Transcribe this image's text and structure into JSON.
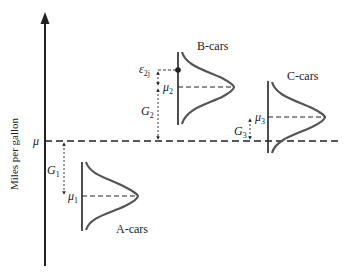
{
  "diagram": {
    "y_axis_label": "Miles per gallon",
    "baseline_label": "μ",
    "colors": {
      "ink": "#222222",
      "curve": "#555555",
      "background": "#ffffff"
    },
    "groups": [
      {
        "name": "A-cars",
        "mean_symbol": "μ",
        "mean_sub": "1",
        "gap_symbol": "G",
        "gap_sub": "1"
      },
      {
        "name": "B-cars",
        "mean_symbol": "μ",
        "mean_sub": "2",
        "gap_symbol": "G",
        "gap_sub": "2",
        "error_symbol": "ε",
        "error_sub": "2j"
      },
      {
        "name": "C-cars",
        "mean_symbol": "μ",
        "mean_sub": "3",
        "gap_symbol": "G",
        "gap_sub": "3"
      }
    ]
  }
}
